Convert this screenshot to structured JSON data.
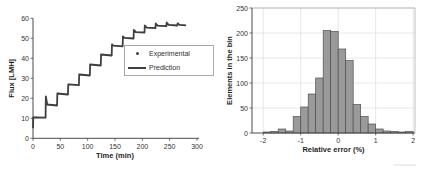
{
  "figure": {
    "background": "#ffffff"
  },
  "colors": {
    "axis": "#4a4a4a",
    "frame": "#a5a5a5",
    "grid": "#dcdcdc",
    "tick_text": "#333333",
    "label_text": "#1f1f1f",
    "line": "#3f3f3f",
    "bar_fill": "#9a9a9a",
    "bar_edge": "#4f4f4f"
  },
  "chart_data": [
    {
      "type": "line",
      "title": "",
      "xlabel": "Time (min)",
      "ylabel": "Flux [LMH]",
      "xlim": [
        0,
        300
      ],
      "ylim": [
        0,
        60
      ],
      "xticks": [
        0,
        50,
        100,
        150,
        200,
        250,
        300
      ],
      "yticks": [
        0,
        10,
        20,
        30,
        40,
        50,
        60
      ],
      "grid": false,
      "legend_position": "middle-right",
      "legend": [
        {
          "label": "Experimental",
          "marker": "dot"
        },
        {
          "label": "Prediction",
          "marker": "line"
        }
      ],
      "series": [
        {
          "name": "Prediction",
          "style": "stepped line with overshoot spikes at each step",
          "points": [
            [
              0,
              5
            ],
            [
              0.5,
              10.5
            ],
            [
              23,
              10.3
            ],
            [
              23.5,
              21
            ],
            [
              26,
              16.9
            ],
            [
              44,
              16.4
            ],
            [
              44.5,
              22.4
            ],
            [
              64,
              21.9
            ],
            [
              64.5,
              27
            ],
            [
              84,
              26.6
            ],
            [
              84.5,
              31.9
            ],
            [
              104,
              31.4
            ],
            [
              104.5,
              36.9
            ],
            [
              124,
              36.4
            ],
            [
              124.5,
              41.9
            ],
            [
              144,
              41.4
            ],
            [
              144.5,
              47
            ],
            [
              147,
              46.3
            ],
            [
              164,
              46
            ],
            [
              164.5,
              51
            ],
            [
              167,
              50.2
            ],
            [
              184,
              49.9
            ],
            [
              184.5,
              54.2
            ],
            [
              188,
              53.1
            ],
            [
              204,
              52.9
            ],
            [
              204.5,
              56.4
            ],
            [
              208,
              55.3
            ],
            [
              224,
              55.1
            ],
            [
              224.5,
              57.4
            ],
            [
              228,
              56.3
            ],
            [
              244,
              56.1
            ],
            [
              244.5,
              57.9
            ],
            [
              248,
              56.7
            ],
            [
              264,
              56.4
            ],
            [
              264.5,
              57.5
            ],
            [
              268,
              56.7
            ],
            [
              280,
              56.5
            ]
          ]
        },
        {
          "name": "Experimental",
          "style": "small dots overlapping the prediction line"
        }
      ]
    },
    {
      "type": "bar",
      "subtype": "histogram",
      "title": "",
      "xlabel": "Relative error (%)",
      "ylabel": "Elements in the bin",
      "xlim": [
        -2.3,
        2.05
      ],
      "ylim": [
        0,
        250
      ],
      "xticks": [
        -2,
        -1,
        0,
        1,
        2
      ],
      "yticks": [
        0,
        50,
        100,
        150,
        200,
        250
      ],
      "grid": true,
      "bin_start": -2,
      "bin_width": 0.2,
      "categories": [
        "-2.0 to -1.8",
        "-1.8 to -1.6",
        "-1.6 to -1.4",
        "-1.4 to -1.2",
        "-1.2 to -1.0",
        "-1.0 to -0.8",
        "-0.8 to -0.6",
        "-0.6 to -0.4",
        "-0.4 to -0.2",
        "-0.2 to 0.0",
        "0.0 to 0.2",
        "0.2 to 0.4",
        "0.4 to 0.6",
        "0.6 to 0.8",
        "0.8 to 1.0",
        "1.0 to 1.2",
        "1.2 to 1.4",
        "1.4 to 1.6",
        "1.6 to 1.8",
        "1.8 to 2.0"
      ],
      "values": [
        2,
        3,
        8,
        4,
        33,
        52,
        78,
        110,
        205,
        203,
        168,
        145,
        57,
        33,
        18,
        8,
        4,
        3,
        2,
        3
      ]
    }
  ]
}
